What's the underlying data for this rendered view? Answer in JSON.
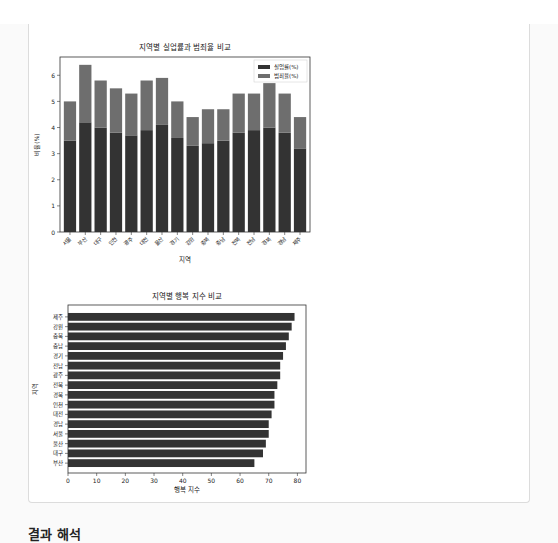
{
  "page": {
    "next_section_heading": "결과 해석"
  },
  "chart_data": [
    {
      "type": "bar",
      "stacked": true,
      "title": "지역별 실업률과 범죄율 비교",
      "xlabel": "지역",
      "ylabel": "비율(%)",
      "ylim": [
        0,
        6.7
      ],
      "yticks": [
        0,
        1,
        2,
        3,
        4,
        5,
        6
      ],
      "legend_position": "upper right",
      "categories": [
        "서울",
        "부산",
        "대구",
        "인천",
        "광주",
        "대전",
        "울산",
        "경기",
        "강원",
        "충북",
        "충남",
        "전북",
        "전남",
        "경북",
        "경남",
        "제주"
      ],
      "series": [
        {
          "name": "실업률(%)",
          "color": "#333333",
          "values": [
            3.5,
            4.2,
            4.0,
            3.8,
            3.7,
            3.9,
            4.1,
            3.6,
            3.3,
            3.4,
            3.5,
            3.8,
            3.9,
            4.0,
            3.8,
            3.2
          ]
        },
        {
          "name": "범죄율(%)",
          "color": "#6e6e6e",
          "values": [
            1.5,
            2.2,
            1.8,
            1.7,
            1.6,
            1.9,
            1.8,
            1.4,
            1.1,
            1.3,
            1.2,
            1.5,
            1.4,
            1.7,
            1.5,
            1.2
          ]
        }
      ]
    },
    {
      "type": "bar",
      "orientation": "horizontal",
      "title": "지역별 행복 지수 비교",
      "xlabel": "행복 지수",
      "ylabel": "지역",
      "xlim": [
        0,
        83
      ],
      "xticks": [
        0,
        10,
        20,
        30,
        40,
        50,
        60,
        70,
        80
      ],
      "categories": [
        "제주",
        "강원",
        "충북",
        "충남",
        "경기",
        "전남",
        "광주",
        "전북",
        "경북",
        "인천",
        "대전",
        "경남",
        "서울",
        "울산",
        "대구",
        "부산"
      ],
      "values": [
        79,
        78,
        77,
        76,
        75,
        74,
        74,
        73,
        72,
        72,
        71,
        70,
        70,
        69,
        68,
        65
      ],
      "color": "#333333"
    }
  ]
}
